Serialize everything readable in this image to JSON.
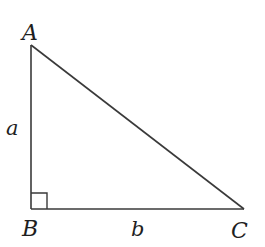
{
  "diagram": {
    "type": "right-triangle",
    "colors": {
      "stroke": "#3a3a3a",
      "text": "#1f1f1f",
      "background": "#ffffff"
    },
    "vertices": {
      "A": {
        "label": "A",
        "x": 31,
        "y": 45
      },
      "B": {
        "label": "B",
        "x": 31,
        "y": 209
      },
      "C": {
        "label": "C",
        "x": 244,
        "y": 209
      }
    },
    "sides": {
      "AB": {
        "label": "a"
      },
      "BC": {
        "label": "b"
      }
    },
    "right_angle_at": "B"
  }
}
